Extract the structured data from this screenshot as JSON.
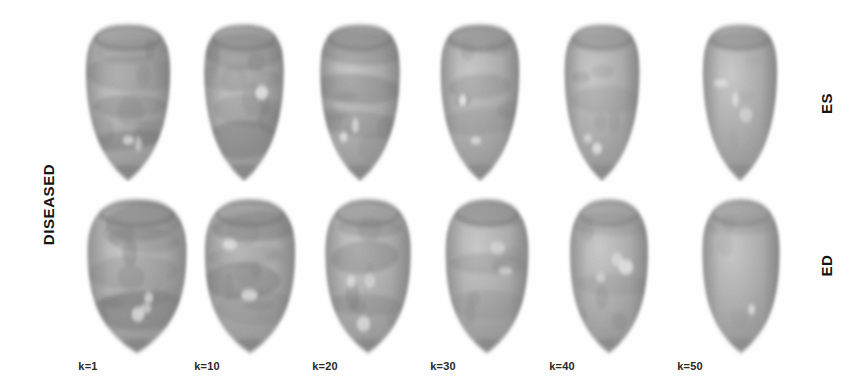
{
  "figure": {
    "background_color": "#ffffff",
    "grid": {
      "rows": 2,
      "columns": 6
    },
    "left_label": "DISEASED",
    "row_labels": [
      {
        "id": "es",
        "label": "ES",
        "name": "end-systole"
      },
      {
        "id": "ed",
        "label": "ED",
        "name": "end-diastole"
      }
    ],
    "column_labels": [
      "k=1",
      "k=10",
      "k=20",
      "k=30",
      "k=40",
      "k=50"
    ],
    "k_values": [
      1,
      10,
      20,
      30,
      40,
      50
    ],
    "colors": {
      "surface_light": "#c9c9c9",
      "surface_mid": "#a9a9a9",
      "surface_dark": "#8a8a8a",
      "band_dark": "#6e6e6e",
      "highlight": "#ececec",
      "label_text": "#151515",
      "caption_text": "#2a2a2a"
    },
    "cells": [
      {
        "row": "es",
        "k": 1,
        "x": 74,
        "y": 20,
        "w": 108,
        "h": 162,
        "shape": "es",
        "seed": 11,
        "bands": 4,
        "detail": 1.0,
        "width_factor": 1.0
      },
      {
        "row": "es",
        "k": 10,
        "x": 192,
        "y": 20,
        "w": 104,
        "h": 162,
        "shape": "es",
        "seed": 23,
        "bands": 4,
        "detail": 0.92,
        "width_factor": 0.98
      },
      {
        "row": "es",
        "k": 20,
        "x": 308,
        "y": 20,
        "w": 104,
        "h": 162,
        "shape": "es",
        "seed": 37,
        "bands": 3,
        "detail": 0.78,
        "width_factor": 0.98
      },
      {
        "row": "es",
        "k": 30,
        "x": 428,
        "y": 20,
        "w": 104,
        "h": 162,
        "shape": "es",
        "seed": 53,
        "bands": 3,
        "detail": 0.62,
        "width_factor": 0.97
      },
      {
        "row": "es",
        "k": 40,
        "x": 552,
        "y": 20,
        "w": 100,
        "h": 162,
        "shape": "es",
        "seed": 71,
        "bands": 2,
        "detail": 0.44,
        "width_factor": 0.96
      },
      {
        "row": "es",
        "k": 50,
        "x": 690,
        "y": 20,
        "w": 100,
        "h": 162,
        "shape": "es",
        "seed": 89,
        "bands": 1,
        "detail": 0.26,
        "width_factor": 0.95
      },
      {
        "row": "ed",
        "k": 1,
        "x": 80,
        "y": 196,
        "w": 114,
        "h": 160,
        "shape": "ed",
        "seed": 13,
        "bands": 5,
        "detail": 1.0,
        "width_factor": 1.06
      },
      {
        "row": "ed",
        "k": 10,
        "x": 196,
        "y": 196,
        "w": 108,
        "h": 160,
        "shape": "ed",
        "seed": 29,
        "bands": 4,
        "detail": 0.9,
        "width_factor": 1.02
      },
      {
        "row": "ed",
        "k": 20,
        "x": 316,
        "y": 196,
        "w": 104,
        "h": 160,
        "shape": "ed",
        "seed": 41,
        "bands": 3,
        "detail": 0.74,
        "width_factor": 1.0
      },
      {
        "row": "ed",
        "k": 30,
        "x": 436,
        "y": 196,
        "w": 102,
        "h": 160,
        "shape": "ed",
        "seed": 59,
        "bands": 3,
        "detail": 0.58,
        "width_factor": 0.99
      },
      {
        "row": "ed",
        "k": 40,
        "x": 560,
        "y": 196,
        "w": 98,
        "h": 160,
        "shape": "ed",
        "seed": 73,
        "bands": 2,
        "detail": 0.4,
        "width_factor": 0.97
      },
      {
        "row": "ed",
        "k": 50,
        "x": 692,
        "y": 196,
        "w": 98,
        "h": 160,
        "shape": "ed",
        "seed": 97,
        "bands": 1,
        "detail": 0.24,
        "width_factor": 0.96
      }
    ],
    "column_caption_positions": [
      88,
      207,
      325,
      443,
      562,
      690
    ],
    "left_label_position": {
      "x": 48,
      "y": 205
    },
    "right_label_positions": [
      {
        "id": "es",
        "x": 826,
        "y": 104
      },
      {
        "id": "ed",
        "x": 826,
        "y": 266
      }
    ]
  }
}
